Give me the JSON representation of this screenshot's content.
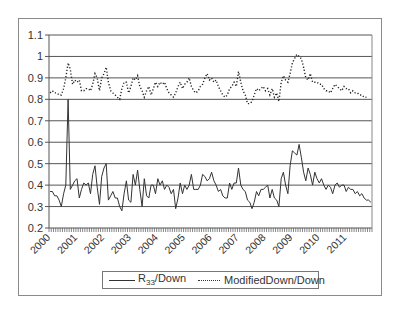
{
  "chart_data": {
    "type": "line",
    "title": "",
    "xlabel": "",
    "ylabel": "",
    "ylim": [
      0.2,
      1.1
    ],
    "yticks": [
      "0.2",
      "0.3",
      "0.4",
      "0.5",
      "0.6",
      "0.7",
      "0.8",
      "0.9",
      "1",
      "1.1"
    ],
    "xticks": [
      "2000",
      "2001",
      "2002",
      "2003",
      "2004",
      "2005",
      "2006",
      "2007",
      "2008",
      "2009",
      "2010",
      "2011"
    ],
    "grid": "horizontal",
    "legend_position": "bottom",
    "x_resolution": "monthly, Jan 2000 - Dec 2011",
    "series": [
      {
        "name": "R33/Down",
        "style": "solid",
        "values": [
          0.37,
          0.37,
          0.35,
          0.35,
          0.33,
          0.3,
          0.36,
          0.4,
          0.8,
          0.38,
          0.4,
          0.42,
          0.43,
          0.34,
          0.38,
          0.41,
          0.4,
          0.41,
          0.36,
          0.45,
          0.49,
          0.39,
          0.31,
          0.44,
          0.48,
          0.5,
          0.33,
          0.35,
          0.37,
          0.34,
          0.34,
          0.3,
          0.28,
          0.36,
          0.42,
          0.33,
          0.32,
          0.45,
          0.4,
          0.47,
          0.38,
          0.3,
          0.43,
          0.35,
          0.34,
          0.4,
          0.4,
          0.36,
          0.43,
          0.4,
          0.42,
          0.38,
          0.4,
          0.39,
          0.36,
          0.38,
          0.29,
          0.34,
          0.41,
          0.36,
          0.4,
          0.38,
          0.4,
          0.45,
          0.38,
          0.38,
          0.38,
          0.4,
          0.45,
          0.44,
          0.42,
          0.43,
          0.46,
          0.42,
          0.4,
          0.37,
          0.38,
          0.35,
          0.34,
          0.34,
          0.41,
          0.38,
          0.41,
          0.41,
          0.48,
          0.4,
          0.38,
          0.37,
          0.33,
          0.32,
          0.29,
          0.32,
          0.37,
          0.35,
          0.38,
          0.38,
          0.39,
          0.4,
          0.34,
          0.38,
          0.34,
          0.33,
          0.3,
          0.43,
          0.46,
          0.4,
          0.36,
          0.49,
          0.56,
          0.55,
          0.54,
          0.59,
          0.53,
          0.46,
          0.42,
          0.48,
          0.45,
          0.4,
          0.46,
          0.43,
          0.41,
          0.43,
          0.4,
          0.38,
          0.4,
          0.39,
          0.36,
          0.4,
          0.41,
          0.39,
          0.4,
          0.4,
          0.37,
          0.39,
          0.38,
          0.38,
          0.36,
          0.37,
          0.35,
          0.36,
          0.34,
          0.33,
          0.33,
          0.32
        ]
      },
      {
        "name": "ModifiedDown/Down",
        "style": "dotted",
        "values": [
          0.83,
          0.84,
          0.83,
          0.83,
          0.82,
          0.82,
          0.85,
          0.9,
          0.97,
          0.94,
          0.87,
          0.89,
          0.88,
          0.89,
          0.84,
          0.84,
          0.85,
          0.85,
          0.84,
          0.87,
          0.92,
          0.9,
          0.84,
          0.9,
          0.92,
          0.95,
          0.88,
          0.84,
          0.83,
          0.82,
          0.81,
          0.8,
          0.85,
          0.88,
          0.88,
          0.83,
          0.86,
          0.9,
          0.89,
          0.91,
          0.86,
          0.84,
          0.81,
          0.84,
          0.86,
          0.82,
          0.85,
          0.88,
          0.86,
          0.88,
          0.87,
          0.88,
          0.85,
          0.83,
          0.82,
          0.81,
          0.83,
          0.86,
          0.88,
          0.85,
          0.87,
          0.88,
          0.9,
          0.86,
          0.84,
          0.83,
          0.84,
          0.86,
          0.87,
          0.9,
          0.92,
          0.89,
          0.9,
          0.88,
          0.89,
          0.86,
          0.84,
          0.82,
          0.81,
          0.82,
          0.85,
          0.86,
          0.88,
          0.86,
          0.93,
          0.88,
          0.84,
          0.82,
          0.78,
          0.78,
          0.79,
          0.82,
          0.85,
          0.84,
          0.85,
          0.86,
          0.84,
          0.85,
          0.82,
          0.85,
          0.81,
          0.83,
          0.79,
          0.88,
          0.91,
          0.89,
          0.88,
          0.92,
          0.97,
          0.99,
          1.01,
          1.0,
          0.99,
          0.95,
          0.9,
          0.89,
          0.92,
          0.88,
          0.88,
          0.88,
          0.87,
          0.87,
          0.85,
          0.84,
          0.84,
          0.83,
          0.85,
          0.87,
          0.86,
          0.85,
          0.84,
          0.86,
          0.85,
          0.85,
          0.83,
          0.84,
          0.83,
          0.83,
          0.82,
          0.82,
          0.81,
          0.81
        ]
      }
    ]
  },
  "legend": {
    "items": [
      {
        "label_main": "R",
        "label_sub": "33",
        "label_rest": "/Down",
        "style": "solid"
      },
      {
        "label": "ModifiedDown/Down",
        "style": "dotted"
      }
    ]
  }
}
